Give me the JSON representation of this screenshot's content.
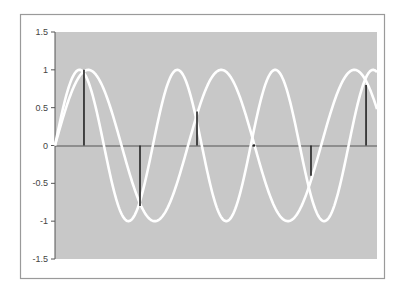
{
  "chart_data": {
    "type": "line",
    "title": "",
    "xlabel": "",
    "ylabel": "",
    "ylim": [
      -1.5,
      1.5
    ],
    "xlim": [
      0,
      1
    ],
    "yticks": [
      1.5,
      1,
      0.5,
      0,
      -0.5,
      -1,
      -1.5
    ],
    "ytick_labels": [
      "1.5",
      "1",
      "0.5",
      "0",
      "-0.5",
      "-1",
      "-1.5"
    ],
    "grid": false,
    "legend": null,
    "series": [
      {
        "name": "sine-high-frequency",
        "kind": "line",
        "color": "#ffffff",
        "cycles": 3.29,
        "amplitude": 1,
        "phase": 0
      },
      {
        "name": "sine-low-frequency",
        "kind": "line",
        "color": "#ffffff",
        "cycles": 2.42,
        "amplitude": 1,
        "phase": 0
      },
      {
        "name": "samples",
        "kind": "stem",
        "color": "#222222",
        "x": [
          0.09,
          0.264,
          0.441,
          0.618,
          0.795,
          0.966
        ],
        "values": [
          1.0,
          -0.8,
          0.45,
          0.0,
          -0.4,
          0.8
        ]
      }
    ]
  },
  "colors": {
    "plot_background": "#c8c8c8",
    "frame_border": "#9a9a9a",
    "axis": "#555555"
  }
}
